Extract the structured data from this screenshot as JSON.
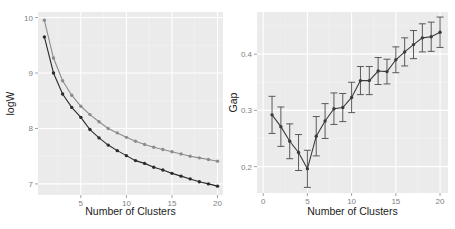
{
  "chart_data": [
    {
      "type": "line",
      "panel": "left",
      "title": "",
      "xlabel": "Number of Clusters",
      "ylabel": "logW",
      "xlim": [
        0.3,
        20.6
      ],
      "ylim": [
        6.8,
        10.1
      ],
      "x_ticks": [
        5,
        10,
        15,
        20
      ],
      "y_ticks": [
        7,
        8,
        9,
        10
      ],
      "grid": true,
      "legend": null,
      "x": [
        1,
        2,
        3,
        4,
        5,
        6,
        7,
        8,
        9,
        10,
        11,
        12,
        13,
        14,
        15,
        16,
        17,
        18,
        19,
        20
      ],
      "series": [
        {
          "name": "logW (expected)",
          "color": "#8c8c8c",
          "values": [
            9.95,
            9.27,
            8.86,
            8.6,
            8.4,
            8.25,
            8.12,
            8.0,
            7.92,
            7.84,
            7.77,
            7.71,
            7.66,
            7.62,
            7.58,
            7.54,
            7.5,
            7.47,
            7.44,
            7.41
          ]
        },
        {
          "name": "logW (observed)",
          "color": "#2b2b2b",
          "values": [
            9.65,
            9.0,
            8.62,
            8.38,
            8.2,
            7.98,
            7.83,
            7.7,
            7.6,
            7.51,
            7.42,
            7.37,
            7.3,
            7.25,
            7.19,
            7.14,
            7.09,
            7.04,
            7.0,
            6.96
          ]
        }
      ]
    },
    {
      "type": "line",
      "panel": "right",
      "title": "",
      "xlabel": "Number of Clusters",
      "ylabel": "Gap",
      "xlim": [
        -0.7,
        20.9
      ],
      "ylim": [
        0.153,
        0.475
      ],
      "x_ticks": [
        0,
        5,
        10,
        15,
        20
      ],
      "y_ticks": [
        0.2,
        0.3,
        0.4
      ],
      "y_tick_labels": [
        "0.2",
        "0.3",
        "0.4"
      ],
      "grid": true,
      "legend": null,
      "error_bars": true,
      "x": [
        1,
        2,
        3,
        4,
        5,
        6,
        7,
        8,
        9,
        10,
        11,
        12,
        13,
        14,
        15,
        16,
        17,
        18,
        19,
        20
      ],
      "series": [
        {
          "name": "Gap",
          "color": "#3a3a3a",
          "values": [
            0.292,
            0.271,
            0.245,
            0.225,
            0.196,
            0.254,
            0.281,
            0.303,
            0.305,
            0.323,
            0.353,
            0.353,
            0.37,
            0.369,
            0.39,
            0.404,
            0.417,
            0.429,
            0.431,
            0.439
          ],
          "error": [
            0.033,
            0.035,
            0.031,
            0.032,
            0.033,
            0.035,
            0.031,
            0.028,
            0.025,
            0.027,
            0.025,
            0.025,
            0.024,
            0.022,
            0.023,
            0.025,
            0.025,
            0.025,
            0.026,
            0.027
          ]
        }
      ]
    }
  ],
  "colors": {
    "panel_background": "#ebebeb",
    "grid_major": "#ffffff",
    "grid_minor": "#f4f4f4",
    "tick_label": "#7f7f7f",
    "axis_title": "#222222"
  }
}
